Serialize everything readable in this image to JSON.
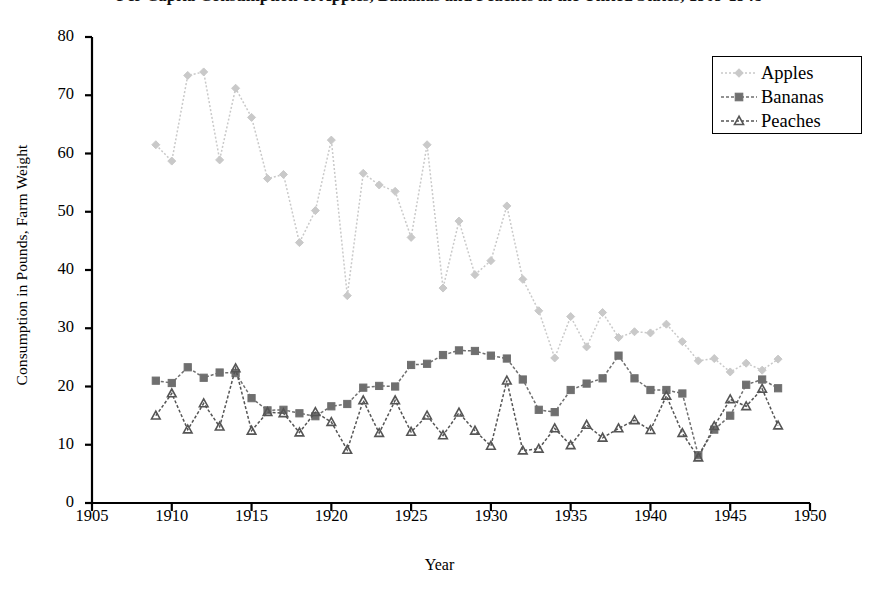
{
  "chart_data": {
    "type": "line",
    "title": "Per Capita Consumption of Apples, Bananas and Peaches in the United States, 1909-1948",
    "xlabel": "Year",
    "ylabel": "Consumption in Pounds, Farm Weight",
    "xlim": [
      1905,
      1950
    ],
    "ylim": [
      0,
      80
    ],
    "xticks": [
      1905,
      1910,
      1915,
      1920,
      1925,
      1930,
      1935,
      1940,
      1945,
      1950
    ],
    "yticks": [
      0,
      10,
      20,
      30,
      40,
      50,
      60,
      70,
      80
    ],
    "grid": false,
    "legend_position": "top-right",
    "legend": [
      "Apples",
      "Bananas",
      "Peaches"
    ],
    "x": [
      1909,
      1910,
      1911,
      1912,
      1913,
      1914,
      1915,
      1916,
      1917,
      1918,
      1919,
      1920,
      1921,
      1922,
      1923,
      1924,
      1925,
      1926,
      1927,
      1928,
      1929,
      1930,
      1931,
      1932,
      1933,
      1934,
      1935,
      1936,
      1937,
      1938,
      1939,
      1940,
      1941,
      1942,
      1943,
      1944,
      1945,
      1946,
      1947,
      1948
    ],
    "series": [
      {
        "name": "Apples",
        "marker": "diamond",
        "color": "#c9c9c9",
        "values": [
          61.5,
          58.7,
          73.4,
          74.0,
          58.9,
          71.2,
          66.2,
          55.7,
          56.4,
          44.7,
          50.2,
          62.3,
          35.6,
          56.6,
          54.6,
          53.5,
          45.6,
          61.5,
          36.9,
          48.4,
          39.2,
          41.6,
          51.0,
          38.4,
          33.0,
          24.9,
          32.0,
          26.8,
          32.7,
          28.4,
          29.4,
          29.2,
          30.7,
          27.7,
          24.4,
          24.8,
          22.5,
          24.0,
          22.8,
          24.7
        ]
      },
      {
        "name": "Bananas",
        "marker": "square",
        "color": "#6f6f6f",
        "values": [
          21.0,
          20.6,
          23.3,
          21.5,
          22.4,
          22.3,
          18.0,
          15.9,
          16.0,
          15.4,
          14.9,
          16.6,
          17.0,
          19.8,
          20.1,
          20.0,
          23.7,
          23.9,
          25.4,
          26.2,
          26.1,
          25.3,
          24.8,
          21.2,
          16.0,
          15.6,
          19.4,
          20.5,
          21.4,
          25.3,
          21.4,
          19.4,
          19.4,
          18.8,
          8.2,
          12.6,
          15.0,
          20.3,
          21.2,
          19.7
        ]
      },
      {
        "name": "Peaches",
        "marker": "triangle",
        "color": "#555555",
        "values": [
          15.0,
          18.8,
          12.6,
          17.1,
          13.1,
          23.1,
          12.4,
          15.6,
          15.4,
          12.1,
          15.6,
          13.9,
          9.1,
          17.6,
          12.0,
          17.6,
          12.2,
          15.0,
          11.6,
          15.5,
          12.4,
          9.8,
          21.0,
          9.0,
          9.3,
          12.8,
          9.9,
          13.4,
          11.2,
          12.8,
          14.2,
          12.5,
          18.4,
          12.0,
          7.8,
          13.2,
          17.8,
          16.6,
          19.6,
          13.3
        ]
      }
    ]
  }
}
